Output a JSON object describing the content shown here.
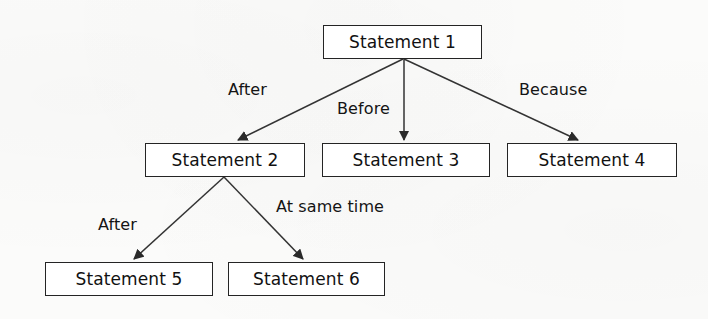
{
  "diagram": {
    "background_color": "#fbfbfa",
    "box_border_color": "#242424",
    "box_fill_color": "#ffffff",
    "line_color": "#333333",
    "text_color": "#111111",
    "nodes": [
      {
        "id": "s1",
        "label": "Statement 1",
        "x": 323,
        "y": 25,
        "w": 159,
        "h": 34
      },
      {
        "id": "s2",
        "label": "Statement 2",
        "x": 145,
        "y": 143,
        "w": 160,
        "h": 34
      },
      {
        "id": "s3",
        "label": "Statement 3",
        "x": 322,
        "y": 143,
        "w": 168,
        "h": 34
      },
      {
        "id": "s4",
        "label": "Statement 4",
        "x": 507,
        "y": 143,
        "w": 170,
        "h": 34
      },
      {
        "id": "s5",
        "label": "Statement 5",
        "x": 45,
        "y": 262,
        "w": 168,
        "h": 34
      },
      {
        "id": "s6",
        "label": "Statement 6",
        "x": 228,
        "y": 262,
        "w": 157,
        "h": 34
      }
    ],
    "edges": [
      {
        "id": "e1",
        "from": "s1",
        "to": "s2",
        "label": "After",
        "label_x": 228,
        "label_y": 80
      },
      {
        "id": "e2",
        "from": "s1",
        "to": "s3",
        "label": "Before",
        "label_x": 337,
        "label_y": 99
      },
      {
        "id": "e3",
        "from": "s1",
        "to": "s4",
        "label": "Because",
        "label_x": 519,
        "label_y": 80
      },
      {
        "id": "e4",
        "from": "s2",
        "to": "s5",
        "label": "After",
        "label_x": 98,
        "label_y": 215
      },
      {
        "id": "e5",
        "from": "s2",
        "to": "s6",
        "label": "At same time",
        "label_x": 276,
        "label_y": 197
      }
    ]
  }
}
